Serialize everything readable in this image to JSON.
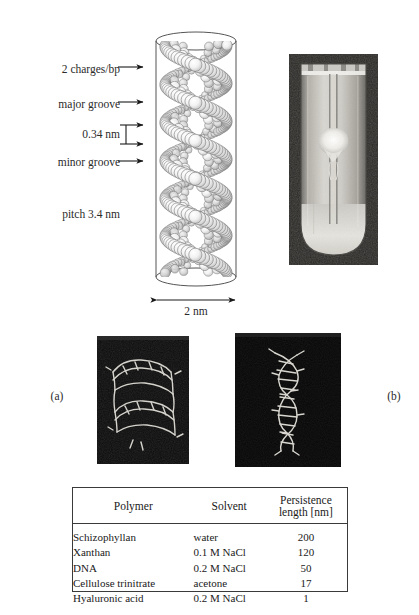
{
  "figure": {
    "cropped_text_trace": "··   ·",
    "dna_schematic": {
      "callouts": [
        {
          "id": "charges",
          "label": "2 charges/bp"
        },
        {
          "id": "major-groove",
          "label": "major groove"
        },
        {
          "id": "rise",
          "label": "0.34 nm"
        },
        {
          "id": "minor-groove",
          "label": "minor groove"
        }
      ],
      "pitch_label": "pitch 3.4 nm",
      "diameter_label": "2 nm"
    },
    "panels": [
      {
        "id": "a",
        "label": "(a)"
      },
      {
        "id": "b",
        "label": "(b)"
      }
    ]
  },
  "table": {
    "headers": [
      "Polymer",
      "Solvent",
      "Persistence length [nm]"
    ],
    "rows": [
      {
        "polymer": "Schizophyllan",
        "solvent": "water",
        "persistence_length": "200"
      },
      {
        "polymer": "Xanthan",
        "solvent": "0.1 M NaCl",
        "persistence_length": "120"
      },
      {
        "polymer": "DNA",
        "solvent": "0.2 M NaCl",
        "persistence_length": "50"
      },
      {
        "polymer": "Cellulose trinitrate",
        "solvent": "acetone",
        "persistence_length": "17"
      },
      {
        "polymer": "Hyaluronic acid",
        "solvent": "0.2 M NaCl",
        "persistence_length": "1"
      }
    ]
  },
  "colors": {
    "ink": "#1a1a1a",
    "rule": "#3a3a3a",
    "photo_dark": "#1d1d1d",
    "photo_light": "#d8d6d0",
    "panel_bg": "#090909"
  }
}
